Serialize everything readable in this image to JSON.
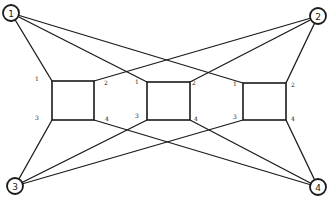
{
  "diagram": {
    "type": "graph",
    "nodes": [
      {
        "id": "1",
        "label": "1",
        "x": 11,
        "y": 13,
        "r": 8
      },
      {
        "id": "2",
        "label": "2",
        "x": 318,
        "y": 16,
        "r": 8
      },
      {
        "id": "3",
        "label": "3",
        "x": 15,
        "y": 186,
        "r": 8
      },
      {
        "id": "4",
        "label": "4",
        "x": 318,
        "y": 187,
        "r": 8
      }
    ],
    "blocks": [
      {
        "id": "left",
        "x1": 52,
        "y1": 81,
        "x2": 94,
        "y2": 120,
        "port_labels": [
          {
            "text": "1",
            "x": 37,
            "y": 78
          },
          {
            "text": "2",
            "x": 106,
            "y": 82
          },
          {
            "text": "3",
            "x": 37,
            "y": 117
          },
          {
            "text": "4",
            "x": 107,
            "y": 118
          }
        ]
      },
      {
        "id": "middle",
        "x1": 147,
        "y1": 82,
        "x2": 190,
        "y2": 120,
        "port_labels": [
          {
            "text": "1",
            "x": 137,
            "y": 81
          },
          {
            "text": "2",
            "x": 194,
            "y": 82
          },
          {
            "text": "3",
            "x": 137,
            "y": 115
          },
          {
            "text": "4",
            "x": 196,
            "y": 118
          }
        ]
      },
      {
        "id": "right",
        "x1": 243,
        "y1": 83,
        "x2": 286,
        "y2": 120,
        "port_labels": [
          {
            "text": "1",
            "x": 235,
            "y": 83
          },
          {
            "text": "2",
            "x": 293,
            "y": 84
          },
          {
            "text": "3",
            "x": 235,
            "y": 116
          },
          {
            "text": "4",
            "x": 293,
            "y": 118
          }
        ]
      }
    ],
    "edges": [
      {
        "from": "1",
        "to": "left.TL",
        "x1": 11,
        "y1": 13,
        "x2": 52,
        "y2": 81
      },
      {
        "from": "1",
        "to": "middle.TL",
        "x1": 11,
        "y1": 13,
        "x2": 147,
        "y2": 82
      },
      {
        "from": "1",
        "to": "right.TL",
        "x1": 11,
        "y1": 13,
        "x2": 243,
        "y2": 83
      },
      {
        "from": "2",
        "to": "right.TR",
        "x1": 318,
        "y1": 16,
        "x2": 286,
        "y2": 83
      },
      {
        "from": "2",
        "to": "middle.TR",
        "x1": 318,
        "y1": 16,
        "x2": 190,
        "y2": 82
      },
      {
        "from": "2",
        "to": "left.TR",
        "x1": 318,
        "y1": 16,
        "x2": 94,
        "y2": 81
      },
      {
        "from": "3",
        "to": "left.BL",
        "x1": 15,
        "y1": 186,
        "x2": 52,
        "y2": 120
      },
      {
        "from": "3",
        "to": "middle.BL",
        "x1": 15,
        "y1": 186,
        "x2": 147,
        "y2": 120
      },
      {
        "from": "3",
        "to": "right.BL",
        "x1": 15,
        "y1": 186,
        "x2": 243,
        "y2": 120
      },
      {
        "from": "4",
        "to": "right.BR",
        "x1": 318,
        "y1": 187,
        "x2": 286,
        "y2": 120
      },
      {
        "from": "4",
        "to": "middle.BR",
        "x1": 318,
        "y1": 187,
        "x2": 190,
        "y2": 120
      },
      {
        "from": "4",
        "to": "left.BR",
        "x1": 318,
        "y1": 187,
        "x2": 94,
        "y2": 120
      }
    ],
    "colors": {
      "stroke": "#1a1a1a",
      "background": "#ffffff"
    }
  }
}
